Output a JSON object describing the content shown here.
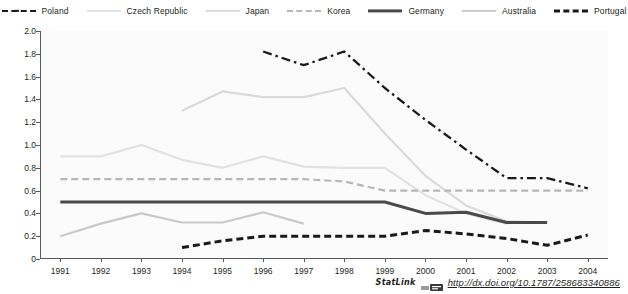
{
  "legend": {
    "position": "top-center",
    "items": [
      {
        "label": "Poland",
        "style": "dash-dot",
        "color": "#1a1a1a",
        "swatch_class": "sw-dashdot"
      },
      {
        "label": "Czech Republic",
        "style": "solid",
        "color": "#e2e2e2",
        "swatch_class": "sw-solid-lightest"
      },
      {
        "label": "Japan",
        "style": "solid",
        "color": "#dadada",
        "swatch_class": "sw-solid-light"
      },
      {
        "label": "Korea",
        "style": "dashed",
        "color": "#b7b7b7",
        "swatch_class": "sw-dash-gray"
      },
      {
        "label": "Germany",
        "style": "solid-bold",
        "color": "#4a4a4a",
        "swatch_class": "sw-solid-dark"
      },
      {
        "label": "Australia",
        "style": "solid",
        "color": "#c9c9c9",
        "swatch_class": "sw-solid-mid"
      },
      {
        "label": "Portugal",
        "style": "dashed-bold",
        "color": "#1a1a1a",
        "swatch_class": "sw-dash-dark"
      }
    ]
  },
  "footer": {
    "statlink_label": "StatLink",
    "url": "http://dx.doi.org/10.1787/258683340886"
  },
  "chart_data": {
    "type": "line",
    "title": "",
    "subtitle": "",
    "xlabel": "",
    "ylabel": "",
    "grid": false,
    "legend_position": "top",
    "x": [
      1991,
      1992,
      1993,
      1994,
      1995,
      1996,
      1997,
      1998,
      1999,
      2000,
      2001,
      2002,
      2003,
      2004
    ],
    "xtick_labels": [
      "1991",
      "1992",
      "1993",
      "1994",
      "1995",
      "1996",
      "1997",
      "1998",
      "1999",
      "2000",
      "2001",
      "2002",
      "2003",
      "2004"
    ],
    "ylim": [
      0,
      2.0
    ],
    "ytick_values": [
      0,
      0.2,
      0.4,
      0.6,
      0.8,
      1.0,
      1.2,
      1.4,
      1.6,
      1.8,
      2.0
    ],
    "ytick_labels": [
      "0",
      "0.2",
      "0.4",
      "0.6",
      "0.8",
      "1.0",
      "1.2",
      "1.4",
      "1.6",
      "1.8",
      "2.0"
    ],
    "series": [
      {
        "name": "Poland",
        "color": "#1a1a1a",
        "style": "dash-dot",
        "width": 2.3,
        "x": [
          1996,
          1997,
          1998,
          1999,
          2000,
          2001,
          2002,
          2003,
          2004
        ],
        "values": [
          1.82,
          1.7,
          1.82,
          1.5,
          1.22,
          0.96,
          0.71,
          0.71,
          0.62
        ]
      },
      {
        "name": "Czech Republic",
        "color": "#e2e2e2",
        "style": "solid",
        "width": 2.2,
        "x": [
          1991,
          1992,
          1993,
          1994,
          1995,
          1996,
          1997,
          1998,
          1999,
          2000,
          2001,
          2002
        ],
        "values": [
          0.9,
          0.9,
          1.0,
          0.87,
          0.8,
          0.9,
          0.81,
          0.8,
          0.8,
          0.56,
          0.4,
          0.31
        ]
      },
      {
        "name": "Japan",
        "color": "#dadada",
        "style": "solid",
        "width": 2.2,
        "x": [
          1994,
          1995,
          1996,
          1997,
          1998,
          1999,
          2000,
          2001,
          2002,
          2003
        ],
        "values": [
          1.3,
          1.47,
          1.42,
          1.42,
          1.5,
          1.1,
          0.73,
          0.47,
          0.33,
          0.32
        ]
      },
      {
        "name": "Korea",
        "color": "#b7b7b7",
        "style": "dashed",
        "width": 2.2,
        "x": [
          1991,
          1992,
          1993,
          1994,
          1995,
          1996,
          1997,
          1998,
          1999,
          2000,
          2001,
          2002,
          2003,
          2004
        ],
        "values": [
          0.7,
          0.7,
          0.7,
          0.7,
          0.7,
          0.7,
          0.7,
          0.68,
          0.6,
          0.6,
          0.6,
          0.6,
          0.6,
          0.6
        ]
      },
      {
        "name": "Germany",
        "color": "#4a4a4a",
        "style": "solid",
        "width": 3.0,
        "x": [
          1991,
          1992,
          1993,
          1994,
          1995,
          1996,
          1997,
          1998,
          1999,
          2000,
          2001,
          2002,
          2003
        ],
        "values": [
          0.5,
          0.5,
          0.5,
          0.5,
          0.5,
          0.5,
          0.5,
          0.5,
          0.5,
          0.4,
          0.41,
          0.32,
          0.32
        ]
      },
      {
        "name": "Australia",
        "color": "#c9c9c9",
        "style": "solid",
        "width": 2.2,
        "x": [
          1991,
          1992,
          1993,
          1994,
          1995,
          1996,
          1997
        ],
        "values": [
          0.2,
          0.31,
          0.4,
          0.32,
          0.32,
          0.41,
          0.31
        ]
      },
      {
        "name": "Portugal",
        "color": "#1a1a1a",
        "style": "dashed",
        "width": 3.0,
        "x": [
          1994,
          1995,
          1996,
          1997,
          1998,
          1999,
          2000,
          2001,
          2002,
          2003,
          2004
        ],
        "values": [
          0.1,
          0.16,
          0.2,
          0.2,
          0.2,
          0.2,
          0.25,
          0.22,
          0.18,
          0.12,
          0.21
        ]
      }
    ]
  }
}
